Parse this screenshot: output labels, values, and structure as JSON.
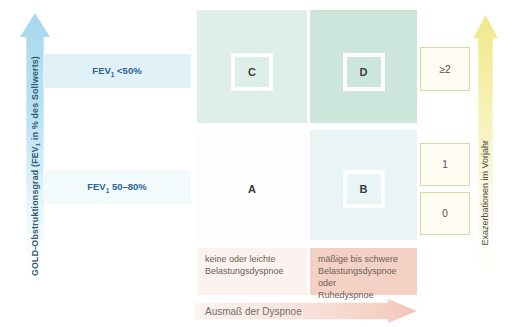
{
  "figure": {
    "type": "gold-abcd-classification-matrix",
    "axes": {
      "left": {
        "label_prefix": "GOLD-Obstruktionsgrad (FEV",
        "label_sub": "1",
        "label_suffix": " in % des Sollwerts)"
      },
      "right": {
        "label": "Exazerbationen im Vorjahr"
      },
      "bottom": {
        "label": "Ausmaß der Dyspnoe"
      }
    },
    "row_labels": [
      {
        "prefix": "FEV",
        "sub": "1",
        "suffix": " <50%"
      },
      {
        "prefix": "FEV",
        "sub": "1",
        "suffix": " 50–80%"
      }
    ],
    "quadrants": [
      {
        "letter": "C"
      },
      {
        "letter": "D"
      },
      {
        "letter": "A"
      },
      {
        "letter": "B"
      }
    ],
    "exacerbation_boxes": [
      {
        "value": "≥2"
      },
      {
        "value": "1"
      },
      {
        "value": "0"
      }
    ],
    "dyspnea_labels": [
      {
        "text": "keine oder leichte\nBelastungsdyspnoe"
      },
      {
        "text": "mäßige bis schwere\nBelastungsdyspnoe oder\nRuhedyspnoe"
      }
    ],
    "colors": {
      "cell_c": "#deeee8",
      "cell_d": "#cde6dc",
      "cell_a": "#fdfdfb",
      "cell_b": "#e9f4f5",
      "fev_band_blue": "#e1f1f8",
      "fev_text_blue": "#2a6496",
      "left_arrow_cyan": "#a7d9ec",
      "right_arrow_yellow": "#efe98a",
      "bottom_arrow_pink": "#f2c3b5",
      "dyspnea_block_pink": "#f5d0c5",
      "dyspnea_block_light": "#fcf3f0",
      "count_box_border": "#dcd5a4",
      "count_box_fill": "#fefcf1"
    }
  }
}
